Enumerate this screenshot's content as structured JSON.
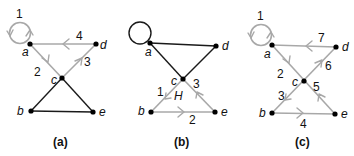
{
  "colors": {
    "edge_black": "#1a1a1a",
    "edge_highlight": "#a8a8a8",
    "node": "#000000"
  },
  "panels": [
    {
      "caption": "(a)",
      "vertices": {
        "a": "a",
        "b": "b",
        "c": "c",
        "d": "d",
        "e": "e"
      },
      "edge_labels": {
        "loop_a": "1",
        "a_c": "2",
        "c_d": "3",
        "d_a": "4"
      },
      "highlighted_walk": [
        "loop a (1)",
        "a→c (2)",
        "c→d (3)",
        "d→a (4)"
      ]
    },
    {
      "caption": "(b)",
      "vertices": {
        "a": "a",
        "b": "b",
        "c": "c",
        "d": "d",
        "e": "e"
      },
      "edge_labels": {
        "c_b": "1",
        "b_e": "2",
        "e_c": "3"
      },
      "subgraph_label": "H",
      "highlighted_walk": [
        "c→b (1)",
        "b→e (2)",
        "e→c (3)"
      ]
    },
    {
      "caption": "(c)",
      "vertices": {
        "a": "a",
        "b": "b",
        "c": "c",
        "d": "d",
        "e": "e"
      },
      "edge_labels": {
        "loop_a": "1",
        "a_c": "2",
        "c_b": "3",
        "b_e": "4",
        "e_c": "5",
        "c_d": "6",
        "d_a": "7"
      },
      "highlighted_walk": [
        "loop a (1)",
        "a→c (2)",
        "c→b (3)",
        "b→e (4)",
        "e→c (5)",
        "c→d (6)",
        "d→a (7)"
      ]
    }
  ]
}
